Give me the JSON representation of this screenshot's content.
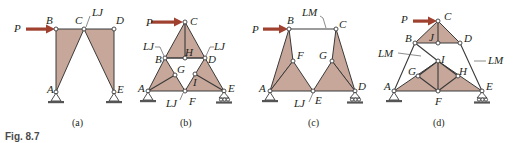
{
  "figure": {
    "label": "Fig. 8.7",
    "colors": {
      "shaded_body": "#c6a79a",
      "member": "#3a3a3a",
      "load_arrow": "#a0412f",
      "text": "#231f20"
    },
    "panels": [
      {
        "caption": "(a)",
        "load": "P",
        "joints": [
          "A",
          "B",
          "C",
          "D",
          "E"
        ],
        "annotations": [
          "LJ"
        ]
      },
      {
        "caption": "(b)",
        "load": "P",
        "joints": [
          "A",
          "B",
          "C",
          "D",
          "E",
          "F",
          "G",
          "H",
          "I"
        ],
        "annotations": [
          "LJ",
          "LJ",
          "LJ"
        ]
      },
      {
        "caption": "(c)",
        "load": "P",
        "joints": [
          "A",
          "B",
          "C",
          "D",
          "E",
          "F",
          "G"
        ],
        "annotations": [
          "LM",
          "LJ"
        ]
      },
      {
        "caption": "(d)",
        "load": "P",
        "joints": [
          "A",
          "B",
          "C",
          "D",
          "E",
          "F",
          "G",
          "H",
          "I",
          "J"
        ],
        "annotations": [
          "LM",
          "LM"
        ]
      }
    ]
  }
}
